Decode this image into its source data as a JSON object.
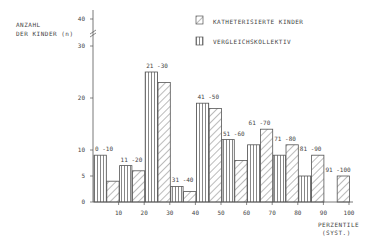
{
  "chart_data": {
    "type": "bar",
    "title": "",
    "ylabel": "ANZAHL DER KINDER (n)",
    "xlabel": "PERZENTILE (SYST.)",
    "ylim": [
      0,
      40
    ],
    "y_axis_break": "between 30 and 40",
    "yticks": [
      0,
      5,
      10,
      20,
      30,
      40
    ],
    "xticks": [
      10,
      20,
      30,
      40,
      50,
      60,
      70,
      80,
      90,
      100
    ],
    "categories": [
      "0-10",
      "11-20",
      "21-30",
      "31-40",
      "41-50",
      "51-60",
      "61-70",
      "71-80",
      "81-90",
      "91-100"
    ],
    "series": [
      {
        "name": "VERGLEICHSKOLLEKTIV",
        "pattern": "vertical-lines",
        "values": [
          9,
          7,
          25,
          3,
          19,
          12,
          11,
          9,
          5,
          0
        ]
      },
      {
        "name": "KATHETERISIERTE KINDER",
        "pattern": "diagonal-lines",
        "values": [
          4,
          6,
          23,
          2,
          18,
          8,
          14,
          11,
          9,
          5
        ]
      }
    ],
    "legend_position": "top-right",
    "grid": false
  },
  "labels": {
    "ylabel_line1": "ANZAHL",
    "ylabel_line2": "DER KINDER (n)",
    "xlabel_line1": "PERZENTILE",
    "xlabel_line2": "(SYST.)",
    "legend_kath": "KATHETERISIERTE  KINDER",
    "legend_vergl": "VERGLEICHSKOLLEKTIV"
  }
}
